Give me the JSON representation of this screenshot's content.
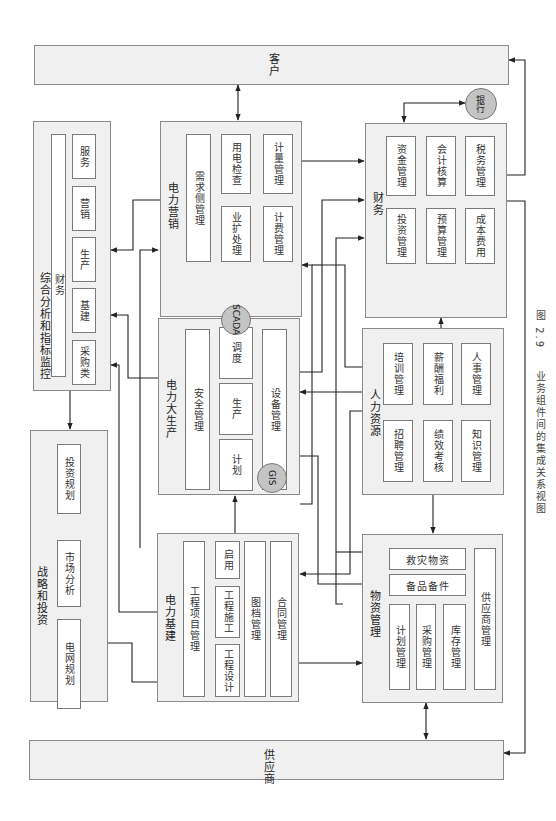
{
  "caption": {
    "number": "图 2.9",
    "text": "业务组件间的集成关系视图"
  },
  "externals": {
    "customer": "客户",
    "supplier": "供应商",
    "bank": "银行"
  },
  "modules": {
    "analysis": {
      "title": "综合分析和指标监控",
      "items": [
        "财务",
        "服务",
        "营销",
        "生产",
        "基建",
        "采购类"
      ]
    },
    "strategy": {
      "title": "战略和投资",
      "items": [
        "投资规划",
        "市场分析",
        "电网规划"
      ]
    },
    "marketing": {
      "title": "电力营销",
      "items": [
        "需求侧管理",
        "用电检查",
        "业扩处理",
        "计量管理",
        "计费管理"
      ]
    },
    "production": {
      "title": "电力大生产",
      "items": [
        "安全管理",
        "调度",
        "生产",
        "计划",
        "设备管理"
      ],
      "badges": [
        "SCADA",
        "GIS"
      ]
    },
    "construction": {
      "title": "电力基建",
      "items": [
        "工程项目管理",
        "启用",
        "工程施工",
        "工程设计",
        "图档管理",
        "合同管理"
      ]
    },
    "finance": {
      "title": "财务",
      "items": [
        "资金管理",
        "会计核算",
        "税务管理",
        "投资管理",
        "预算管理",
        "成本费用"
      ]
    },
    "hr": {
      "title": "人力资源",
      "items": [
        "培训管理",
        "薪酬福利",
        "人事管理",
        "招聘管理",
        "绩效考核",
        "知识管理"
      ]
    },
    "materials": {
      "title": "物资管理",
      "items": [
        "救灾物资",
        "备品备件",
        "计划管理",
        "采购管理",
        "库存管理",
        "供应商管理"
      ]
    }
  }
}
